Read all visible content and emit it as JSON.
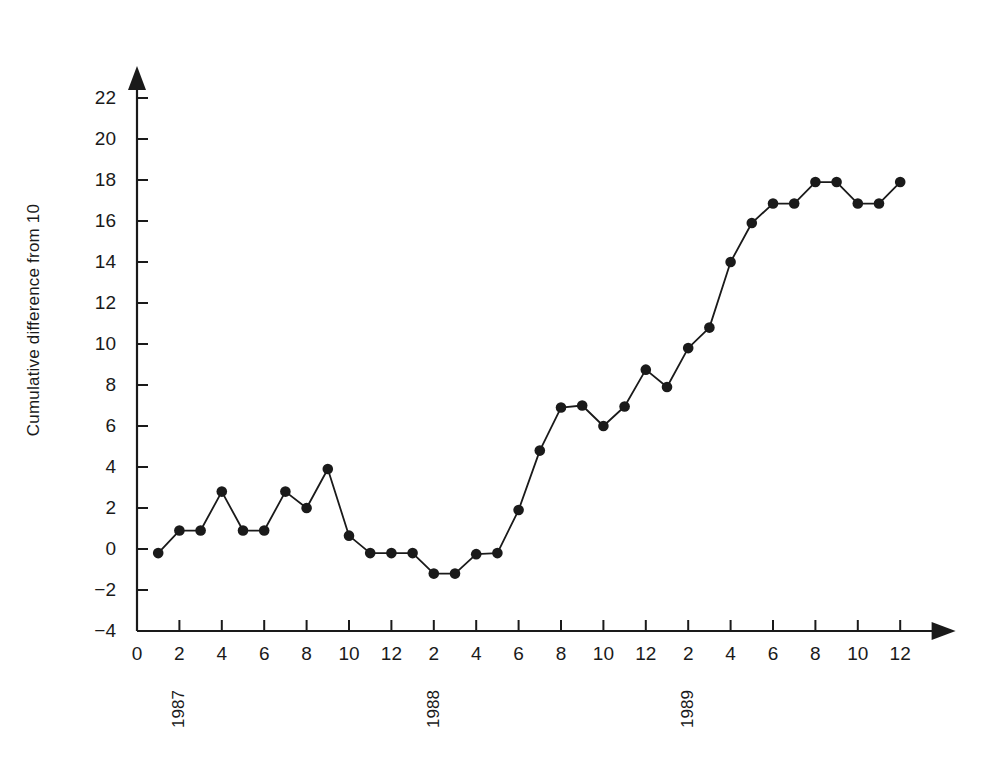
{
  "chart_data": {
    "type": "line",
    "title": "",
    "xlabel": "",
    "ylabel": "Cumulative difference from 10",
    "ylim": [
      -4,
      22
    ],
    "xlim": [
      0,
      37
    ],
    "grid": false,
    "legend": null,
    "marker": "filled-circle",
    "line_color": "#1a1a1a",
    "marker_color": "#1a1a1a",
    "background_color": "#ffffff",
    "y_ticks": [
      -4,
      -2,
      0,
      2,
      4,
      6,
      8,
      10,
      12,
      14,
      16,
      18,
      20,
      22
    ],
    "y_tick_labels": [
      "-4",
      "-2",
      "0",
      "2",
      "4",
      "6",
      "8",
      "10",
      "12",
      "14",
      "16",
      "18",
      "20",
      "22"
    ],
    "x_ticks": [
      0,
      2,
      4,
      6,
      8,
      10,
      12,
      14,
      16,
      18,
      20,
      22,
      24,
      26,
      28,
      30,
      32,
      34,
      36
    ],
    "x_tick_labels": [
      "0",
      "2",
      "4",
      "6",
      "8",
      "10",
      "12",
      "2",
      "4",
      "6",
      "8",
      "10",
      "12",
      "2",
      "4",
      "6",
      "8",
      "10",
      "12"
    ],
    "year_labels": [
      {
        "text": "1987",
        "x": 2
      },
      {
        "text": "1988",
        "x": 14
      },
      {
        "text": "1989",
        "x": 26
      }
    ],
    "x": [
      1,
      2,
      3,
      4,
      5,
      6,
      7,
      8,
      9,
      10,
      11,
      12,
      13,
      14,
      15,
      16,
      17,
      18,
      19,
      20,
      21,
      22,
      23,
      24,
      25,
      26,
      27,
      28,
      29,
      30,
      31,
      32,
      33,
      34,
      35,
      36
    ],
    "values": [
      -0.2,
      0.9,
      0.9,
      2.8,
      0.9,
      0.9,
      2.8,
      2.0,
      3.9,
      0.65,
      -0.2,
      -0.2,
      -0.2,
      -1.2,
      -1.2,
      -0.25,
      -0.2,
      1.9,
      4.8,
      6.9,
      7.0,
      6.0,
      6.95,
      8.75,
      7.9,
      9.8,
      10.8,
      14.0,
      15.9,
      16.85,
      16.85,
      17.9,
      17.9,
      16.85,
      16.85,
      17.9
    ],
    "point_labels": [
      "1987-01: -0.2",
      "1987-02: 0.9",
      "1987-03: 0.9",
      "1987-04: 2.8",
      "1987-05: 0.9",
      "1987-06: 0.9",
      "1987-07: 2.8",
      "1987-08: 2.0",
      "1987-09: 3.9",
      "1987-10: 0.65",
      "1987-11: -0.2",
      "1987-12: -0.2",
      "1988-01: -0.2",
      "1988-02: -1.2",
      "1988-03: -1.2",
      "1988-04: -0.25",
      "1988-05: -0.2",
      "1988-06: 1.9",
      "1988-07: 4.8",
      "1988-08: 6.9",
      "1988-09: 7.0",
      "1988-10: 6.0",
      "1988-11: 6.95",
      "1988-12: 8.75",
      "1989-01: 7.9",
      "1989-02: 9.8",
      "1989-03: 10.8",
      "1989-04: 14.0",
      "1989-05: 15.9",
      "1989-06: 16.85",
      "1989-07: 16.85",
      "1989-08: 17.9",
      "1989-09: 17.9",
      "1989-10: 16.85",
      "1989-11: 16.85",
      "1989-12: 17.9"
    ]
  }
}
